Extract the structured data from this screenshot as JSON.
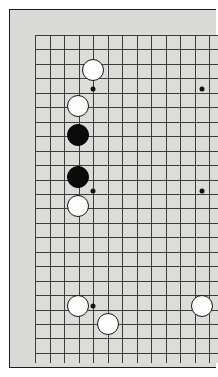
{
  "app": {
    "title": "Go Board",
    "description": "Partial view of a Go (Baduk) game board showing a vertical crop of the grid with black and white stones placed on intersections."
  },
  "board": {
    "background_color": "#d9d9d6",
    "surface_color": "#dcdcd8",
    "line_color": "#3c3c3c",
    "faint_line_color": "#9a9a97",
    "border_color": "#1a1a1a",
    "grid_origin_x": 25,
    "grid_origin_y": 25,
    "grid_spacing_x": 14.5,
    "grid_spacing_y": 14.45,
    "columns_visible": 14,
    "rows_visible": 23,
    "stone_diameter": 22,
    "cropped_edges": [
      "right",
      "top",
      "bottom"
    ]
  },
  "star_points": [
    {
      "name": "star-point-upper-left",
      "x": 83,
      "y": 79
    },
    {
      "name": "star-point-upper-right",
      "x": 192,
      "y": 79
    },
    {
      "name": "star-point-mid-left",
      "x": 83,
      "y": 181
    },
    {
      "name": "star-point-mid-right",
      "x": 192,
      "y": 181
    },
    {
      "name": "star-point-lower-left",
      "x": 83,
      "y": 296
    }
  ],
  "stones": [
    {
      "id": "w1",
      "color": "white",
      "x": 83,
      "y": 60,
      "label": "white-stone"
    },
    {
      "id": "w2",
      "color": "white",
      "x": 68,
      "y": 96,
      "label": "white-stone"
    },
    {
      "id": "b1",
      "color": "black",
      "x": 68,
      "y": 125,
      "label": "black-stone"
    },
    {
      "id": "b2",
      "color": "black",
      "x": 68,
      "y": 167,
      "label": "black-stone"
    },
    {
      "id": "w3",
      "color": "white",
      "x": 68,
      "y": 196,
      "label": "white-stone"
    },
    {
      "id": "w4",
      "color": "white",
      "x": 68,
      "y": 296,
      "label": "white-stone"
    },
    {
      "id": "w5",
      "color": "white",
      "x": 98,
      "y": 314,
      "label": "white-stone"
    },
    {
      "id": "w6",
      "color": "white",
      "x": 192,
      "y": 296,
      "label": "white-stone"
    }
  ],
  "counts": {
    "black_stones": 2,
    "white_stones": 6,
    "total_stones": 8
  },
  "chart_data": {
    "type": "scatter",
    "xlabel": "board column (px)",
    "ylabel": "board row (px)",
    "xlim": [
      25,
      218
    ],
    "ylim": [
      25,
      353
    ],
    "grid": true,
    "legend": [
      "black",
      "white"
    ],
    "series": [
      {
        "name": "black",
        "points": [
          [
            68,
            125
          ],
          [
            68,
            167
          ]
        ]
      },
      {
        "name": "white",
        "points": [
          [
            83,
            60
          ],
          [
            68,
            96
          ],
          [
            68,
            196
          ],
          [
            68,
            296
          ],
          [
            98,
            314
          ],
          [
            192,
            296
          ]
        ]
      }
    ]
  }
}
